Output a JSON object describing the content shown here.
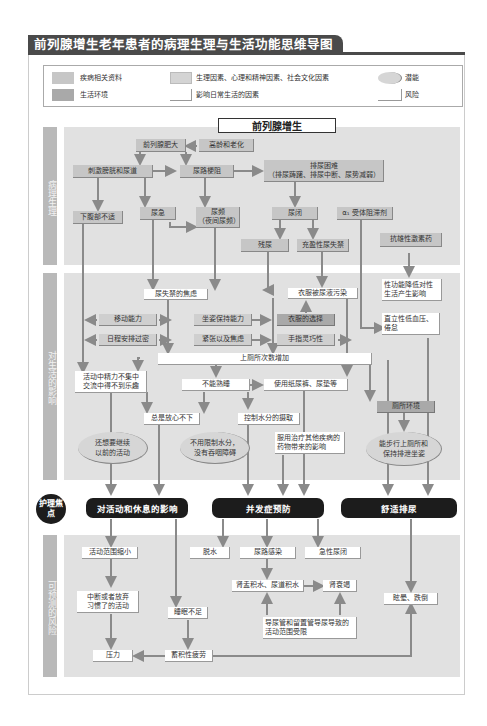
{
  "title": "前列腺增生老年患者的病理生理与生活功能思维导图",
  "legend": {
    "disease": "疾病相关资料",
    "environment": "生活环境",
    "factors": "生理因素、心理和精神因素、社会文化因素",
    "daily_factors": "影响日常生活的因素",
    "potential": "潜能",
    "risk": "风险"
  },
  "sections": {
    "patho": "病理生理",
    "impact": "对生活的影响",
    "focus": "护理焦点",
    "risks": "可预测的风险"
  },
  "colors": {
    "disease_box": "#c6c6c6",
    "environment_box": "#a9a9a9",
    "band": "#e1e1e1",
    "side_label": "#b9b9b9",
    "focus_box": "#1c1c1c",
    "arrow": "#8a8a8a"
  },
  "patho": {
    "main": "前列腺增生",
    "bph_enlarge": "前列腺肥大",
    "aging": "高龄和老化",
    "irritation": "刺激膀胱和尿道",
    "obstruction": "尿路梗阻",
    "difficulty": "排尿困难\n（排尿踌躇、排尿中断、尿势减弱）",
    "lower_abd": "下腹部不适",
    "urgency": "尿急",
    "frequency": "尿频\n（夜间尿频）",
    "retention": "尿闭",
    "alpha_blocker": "α₁ 受体阻滞剂",
    "residual": "残尿",
    "overflow": "充盈性尿失禁",
    "antiandrogen": "抗雄性激素药"
  },
  "impact": {
    "incont_anxiety": "尿失禁的焦虑",
    "clothes_soiled": "衣服被尿液污染",
    "sexual": "性功能降低对性\n生活产生影响",
    "mobility": "移动能力",
    "sitting": "坐姿保持能力",
    "clothing_choice": "衣服的选择",
    "orthostatic": "直立性低血压、\n倦怠",
    "schedule": "日程安排过密",
    "tension": "紧张以及焦虑",
    "dexterity": "手指灵巧性",
    "toilet_more": "上厕所次数增加",
    "concentration": "活动中精力不集中\n交流中得不到乐趣",
    "no_sleep": "不能熟睡",
    "diapers": "使用纸尿裤、尿垫等",
    "toilet_env": "厕所环境",
    "worry": "总是放心不下",
    "water_control": "控制水分的摄取",
    "continue_activity": "还想要继续\n以前的活动",
    "no_water_limit": "不用限制水分，\n没有吞咽障碍",
    "other_meds": "服用治疗其他疾病的\n药物带来的影响",
    "can_walk": "能步行上厕所和\n保持排泄坐姿"
  },
  "focus": {
    "activity_rest": "对活动和休息的影响",
    "complications": "并发症预防",
    "comfortable": "舒适排尿"
  },
  "risks": {
    "activity_shrink": "活动范围缩小",
    "dehydration": "脱水",
    "uti": "尿路感染",
    "acute_retention": "急性尿闭",
    "quit_activity": "中断或者放弃\n习惯了的活动",
    "hydronephrosis": "肾盂积水、尿道积水",
    "renal_failure": "肾衰竭",
    "dizzy_fall": "眩晕、跌倒",
    "sleep_lack": "睡眠不足",
    "catheter": "导尿管和留置管导尿导致的\n活动范围受限",
    "stress": "压力",
    "fatigue": "蓄积性疲劳"
  }
}
